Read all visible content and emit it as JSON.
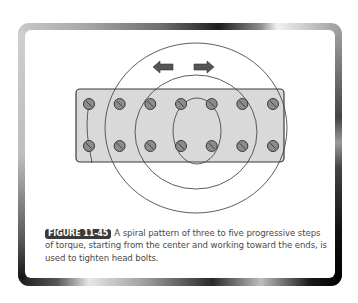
{
  "figure": {
    "label": "FIGURE 11-45",
    "caption": "A spiral pattern of three to five progressive steps of torque, starting from the center and working toward the ends, is used to tighten head bolts."
  },
  "diagram": {
    "bolt_rows": 2,
    "bolts_per_row": 7,
    "spiral_rings": 3,
    "arrows": [
      "arrow-left-icon",
      "arrow-right-icon"
    ],
    "colors": {
      "head_fill": "#d9d9d9",
      "head_outline": "#3a3a3a",
      "bolt_fill": "#8c8c8c",
      "path_stroke": "#4a4a4a",
      "arrow_fill": "#555555",
      "label_bg": "#3a3a3a"
    }
  }
}
